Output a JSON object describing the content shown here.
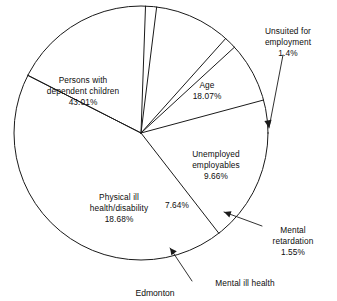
{
  "caption": "Edmonton",
  "chart_data": {
    "type": "pie",
    "title": "",
    "subtitle": "",
    "caption": "Edmonton",
    "xlabel": "",
    "ylabel": "",
    "grid": false,
    "legend_position": "none",
    "center": {
      "x": 141,
      "y": 133
    },
    "radius": 127,
    "start_angle_deg": -63,
    "direction": "clockwise",
    "labels": [
      "Persons with dependent children",
      "Age",
      "Unsuited for employment",
      "Unemployed employables",
      "Mental retardation",
      "Mental ill health",
      "Physical ill health/disability"
    ],
    "values": [
      43.01,
      18.07,
      1.4,
      9.66,
      1.55,
      7.64,
      18.68
    ],
    "value_labels": [
      "43.01%",
      "18.07%",
      "1.4%",
      "9.66%",
      "1.55%",
      "7.64%",
      "18.68%"
    ],
    "slices": [
      {
        "name": "age",
        "label_line1": "Age",
        "label_line2": "",
        "value": 18.07,
        "value_label": "18.07%",
        "label_placement": "inside"
      },
      {
        "name": "unsuited-for-employment",
        "label_line1": "Unsuited for",
        "label_line2": "employment",
        "value": 1.4,
        "value_label": "1.4%",
        "label_placement": "outside-leader"
      },
      {
        "name": "unemployed-employables",
        "label_line1": "Unemployed",
        "label_line2": "employables",
        "value": 9.66,
        "value_label": "9.66%",
        "label_placement": "inside"
      },
      {
        "name": "mental-retardation",
        "label_line1": "Mental",
        "label_line2": "retardation",
        "value": 1.55,
        "value_label": "1.55%",
        "label_placement": "outside-leader"
      },
      {
        "name": "mental-ill-health",
        "label_line1": "Mental ill health",
        "label_line2": "",
        "value": 7.64,
        "value_label": "7.64%",
        "label_placement": "outside-leader-and-inside-percent"
      },
      {
        "name": "physical-ill-health-disability",
        "label_line1": "Physical ill",
        "label_line2": "health/disability",
        "value": 18.68,
        "value_label": "18.68%",
        "label_placement": "inside"
      },
      {
        "name": "persons-with-dependent-children",
        "label_line1": "Persons with",
        "label_line2": "dependent children",
        "value": 43.01,
        "value_label": "43.01%",
        "label_placement": "inside"
      }
    ]
  },
  "labels": {
    "persons_l1": "Persons with",
    "persons_l2": "dependent children",
    "persons_pct": "43.01%",
    "age_l1": "Age",
    "age_pct": "18.07%",
    "unsuited_l1": "Unsuited for",
    "unsuited_l2": "employment",
    "unsuited_pct": "1.4%",
    "unemployed_l1": "Unemployed",
    "unemployed_l2": "employables",
    "unemployed_pct": "9.66%",
    "physical_l1": "Physical ill",
    "physical_l2": "health/disability",
    "physical_pct": "18.68%",
    "mentalill_pct": "7.64%",
    "retardation_l1": "Mental",
    "retardation_l2": "retardation",
    "retardation_pct": "1.55%",
    "mentalill_l1": "Mental ill health"
  },
  "colors": {
    "stroke": "#1a1a1a",
    "text": "#0d0d0d",
    "background": "#ffffff"
  }
}
